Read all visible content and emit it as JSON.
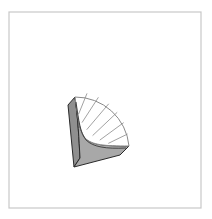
{
  "figure": {
    "description": "3D rendered quarter-cylinder wedge solid with chord lines on the curved top face, shown inside a framed panel",
    "frame": {
      "x": 9,
      "y": 12,
      "width": 192,
      "height": 196,
      "stroke": "#c8c8c8"
    },
    "colors": {
      "background": "#ffffff",
      "face_fill_front": "#a8a8a8",
      "face_fill_side": "#8f8f8f",
      "top_fill": "#ffffff",
      "edge_stroke": "#2a2a2a",
      "chord_stroke": "#8a8a8a"
    },
    "shape": {
      "top_vertex": [
        75,
        97
      ],
      "arc_end": [
        129,
        146
      ],
      "arc_radius": 54,
      "inner_corner": [
        85,
        138
      ],
      "bottom_left": [
        74,
        167
      ],
      "bottom_right": [
        120,
        155
      ],
      "left_side_top": [
        68,
        105
      ],
      "chord_count": 6
    }
  }
}
